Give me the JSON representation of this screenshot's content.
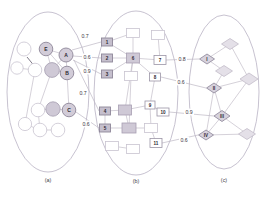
{
  "figure": {
    "type": "three-layer-network-diagram",
    "background_color": "#ffffff",
    "outline_color": "#b9b2c4",
    "shaded_node_color": "#cfc9d6",
    "edge_color": "#c3bdc9"
  },
  "panels": [
    {
      "id": "a",
      "caption": "(a)",
      "caption_x": 48,
      "caption_y": 180,
      "shape": "circle",
      "ellipse": {
        "cx": 48,
        "cy": 92,
        "rx": 41,
        "ry": 80
      }
    },
    {
      "id": "b",
      "caption": "(b)",
      "caption_x": 136,
      "caption_y": 181,
      "shape": "square",
      "ellipse": {
        "cx": 136,
        "cy": 93,
        "rx": 42,
        "ry": 82
      }
    },
    {
      "id": "c",
      "caption": "(c)",
      "caption_x": 224,
      "caption_y": 180,
      "shape": "diamond",
      "ellipse": {
        "cx": 224,
        "cy": 92,
        "rx": 35,
        "ry": 77
      }
    }
  ],
  "nodes_a": [
    {
      "id": "a1",
      "label": "",
      "x": 24,
      "y": 49,
      "r": 7.0,
      "style": "plain"
    },
    {
      "id": "a2",
      "label": "",
      "x": 17,
      "y": 68,
      "r": 6.2,
      "style": "plain"
    },
    {
      "id": "a3",
      "label": "",
      "x": 35,
      "y": 70,
      "r": 6.8,
      "style": "plain"
    },
    {
      "id": "aE",
      "label": "E",
      "x": 46,
      "y": 49,
      "r": 6.8,
      "style": "label"
    },
    {
      "id": "aA",
      "label": "A",
      "x": 66,
      "y": 55,
      "r": 7.0,
      "style": "label"
    },
    {
      "id": "a4",
      "label": "",
      "x": 52,
      "y": 70,
      "r": 7.4,
      "style": "shaded"
    },
    {
      "id": "aB",
      "label": "B",
      "x": 67,
      "y": 73,
      "r": 6.8,
      "style": "label"
    },
    {
      "id": "a5",
      "label": "",
      "x": 38,
      "y": 110,
      "r": 6.8,
      "style": "plain"
    },
    {
      "id": "a6",
      "label": "",
      "x": 53,
      "y": 109,
      "r": 7.2,
      "style": "shaded"
    },
    {
      "id": "aC",
      "label": "C",
      "x": 69,
      "y": 110,
      "r": 6.8,
      "style": "label"
    },
    {
      "id": "a7",
      "label": "",
      "x": 25,
      "y": 124,
      "r": 6.6,
      "style": "plain"
    },
    {
      "id": "a8",
      "label": "",
      "x": 40,
      "y": 130,
      "r": 6.8,
      "style": "plain"
    },
    {
      "id": "a9",
      "label": "",
      "x": 58,
      "y": 130,
      "r": 6.8,
      "style": "plain"
    }
  ],
  "edges_a": [
    {
      "from": "aE",
      "to": "aA"
    },
    {
      "from": "aE",
      "to": "a4"
    },
    {
      "from": "aE",
      "to": "aB"
    },
    {
      "from": "aA",
      "to": "aB"
    },
    {
      "from": "aA",
      "to": "a4"
    },
    {
      "from": "a4",
      "to": "aB"
    },
    {
      "from": "a5",
      "to": "a6"
    },
    {
      "from": "a6",
      "to": "aC"
    },
    {
      "from": "a7",
      "to": "a8"
    },
    {
      "from": "a8",
      "to": "a9"
    },
    {
      "from": "a8",
      "to": "a5"
    },
    {
      "from": "a3",
      "to": "a2"
    },
    {
      "from": "a4",
      "to": "a5"
    },
    {
      "from": "aB",
      "to": "aC"
    },
    {
      "from": "a3",
      "to": "a7"
    }
  ],
  "edge_a_dark": {
    "x1": 27,
    "y1": 57,
    "x2": 40,
    "y2": 73
  },
  "nodes_b": [
    {
      "id": "b1",
      "label": "1",
      "x": 107,
      "y": 42,
      "w": 11,
      "h": 8,
      "style": "labelshaded"
    },
    {
      "id": "b2",
      "label": "2",
      "x": 107,
      "y": 58,
      "w": 11,
      "h": 8,
      "style": "labelshaded"
    },
    {
      "id": "b3",
      "label": "3",
      "x": 107,
      "y": 74,
      "w": 11,
      "h": 8,
      "style": "labelshaded"
    },
    {
      "id": "b4",
      "label": "4",
      "x": 105,
      "y": 111,
      "w": 11,
      "h": 8,
      "style": "labelshaded"
    },
    {
      "id": "b5",
      "label": "5",
      "x": 105,
      "y": 128,
      "w": 11,
      "h": 8,
      "style": "labelshaded"
    },
    {
      "id": "b6",
      "label": "6",
      "x": 133,
      "y": 58,
      "w": 13,
      "h": 10,
      "style": "shaded"
    },
    {
      "id": "b7",
      "label": "7",
      "x": 160,
      "y": 60,
      "w": 12,
      "h": 9,
      "style": "label"
    },
    {
      "id": "b8",
      "label": "8",
      "x": 155,
      "y": 77,
      "w": 11,
      "h": 8,
      "style": "label"
    },
    {
      "id": "b9",
      "label": "9",
      "x": 150,
      "y": 105,
      "w": 10,
      "h": 8,
      "style": "label"
    },
    {
      "id": "b10",
      "label": "10",
      "x": 163,
      "y": 112,
      "w": 12,
      "h": 8,
      "style": "label"
    },
    {
      "id": "b11",
      "label": "11",
      "x": 156,
      "y": 143,
      "w": 12,
      "h": 9,
      "style": "label"
    },
    {
      "id": "b12",
      "label": "",
      "x": 133,
      "y": 33,
      "w": 13,
      "h": 9,
      "style": "plain"
    },
    {
      "id": "b13",
      "label": "",
      "x": 158,
      "y": 35,
      "w": 13,
      "h": 9,
      "style": "plain"
    },
    {
      "id": "b14",
      "label": "",
      "x": 131,
      "y": 76,
      "w": 13,
      "h": 9,
      "style": "plain"
    },
    {
      "id": "b15",
      "label": "",
      "x": 125,
      "y": 110,
      "w": 13,
      "h": 10,
      "style": "shaded"
    },
    {
      "id": "b16",
      "label": "",
      "x": 129,
      "y": 128,
      "w": 14,
      "h": 10,
      "style": "shaded"
    },
    {
      "id": "b17",
      "label": "",
      "x": 151,
      "y": 128,
      "w": 13,
      "h": 9,
      "style": "plain"
    },
    {
      "id": "b18",
      "label": "",
      "x": 112,
      "y": 146,
      "w": 13,
      "h": 9,
      "style": "plain"
    },
    {
      "id": "b19",
      "label": "",
      "x": 133,
      "y": 149,
      "w": 13,
      "h": 9,
      "style": "plain"
    }
  ],
  "edges_b": [
    {
      "from": "b1",
      "to": "b6"
    },
    {
      "from": "b2",
      "to": "b6"
    },
    {
      "from": "b3",
      "to": "b6"
    },
    {
      "from": "b6",
      "to": "b7"
    },
    {
      "from": "b6",
      "to": "b12"
    },
    {
      "from": "b6",
      "to": "b14"
    },
    {
      "from": "b6",
      "to": "b8"
    },
    {
      "from": "b12",
      "to": "b1"
    },
    {
      "from": "b7",
      "to": "b13"
    },
    {
      "from": "b8",
      "to": "b9"
    },
    {
      "from": "b9",
      "to": "b17"
    },
    {
      "from": "b4",
      "to": "b15"
    },
    {
      "from": "b15",
      "to": "b9"
    },
    {
      "from": "b5",
      "to": "b16"
    },
    {
      "from": "b16",
      "to": "b15"
    },
    {
      "from": "b16",
      "to": "b17"
    },
    {
      "from": "b17",
      "to": "b11"
    },
    {
      "from": "b18",
      "to": "b19"
    },
    {
      "from": "b6",
      "to": "b15"
    },
    {
      "from": "b14",
      "to": "b16"
    },
    {
      "from": "b4",
      "to": "b5"
    },
    {
      "from": "b10",
      "to": "b9"
    }
  ],
  "nodes_c": [
    {
      "id": "c1",
      "label": "I",
      "x": 207,
      "y": 59,
      "w": 15,
      "h": 10,
      "style": "label"
    },
    {
      "id": "c2",
      "label": "II",
      "x": 214,
      "y": 88,
      "w": 15,
      "h": 10,
      "style": "label"
    },
    {
      "id": "c3",
      "label": "III",
      "x": 222,
      "y": 116,
      "w": 16,
      "h": 11,
      "style": "label"
    },
    {
      "id": "c4",
      "label": "IV",
      "x": 206,
      "y": 135,
      "w": 15,
      "h": 10,
      "style": "label"
    },
    {
      "id": "cd1",
      "label": "",
      "x": 230,
      "y": 44,
      "w": 17,
      "h": 11,
      "style": "plain"
    },
    {
      "id": "cd2",
      "label": "",
      "x": 224,
      "y": 71,
      "w": 17,
      "h": 11,
      "style": "plain"
    },
    {
      "id": "cd3",
      "label": "",
      "x": 249,
      "y": 79,
      "w": 18,
      "h": 12,
      "style": "plain"
    },
    {
      "id": "cd4",
      "label": "",
      "x": 247,
      "y": 134,
      "w": 17,
      "h": 11,
      "style": "plain"
    }
  ],
  "edges_c": [
    {
      "from": "c1",
      "to": "cd1"
    },
    {
      "from": "c1",
      "to": "cd2"
    },
    {
      "from": "cd1",
      "to": "cd3"
    },
    {
      "from": "cd2",
      "to": "c2"
    },
    {
      "from": "cd3",
      "to": "c2"
    },
    {
      "from": "c2",
      "to": "c3"
    },
    {
      "from": "c3",
      "to": "c4"
    },
    {
      "from": "c3",
      "to": "cd4"
    },
    {
      "from": "c4",
      "to": "cd4"
    },
    {
      "from": "cd3",
      "to": "c3"
    },
    {
      "from": "c4",
      "to": "c2"
    }
  ],
  "inter_edges_ab": [
    {
      "weight": "0.7",
      "label_x": 85,
      "label_y": 36,
      "x1": 72,
      "y1": 50,
      "x2": 101,
      "y2": 42
    },
    {
      "weight": "0.6",
      "label_x": 87,
      "label_y": 57,
      "x1": 73,
      "y1": 56,
      "x2": 101,
      "y2": 58
    },
    {
      "weight": "0.9",
      "label_x": 87,
      "label_y": 71,
      "x1": 73,
      "y1": 60,
      "x2": 101,
      "y2": 74
    },
    {
      "weight": "0.7",
      "label_x": 83,
      "label_y": 93,
      "x1": 74,
      "y1": 60,
      "x2": 99,
      "y2": 111
    },
    {
      "weight": "0.6",
      "label_x": 86,
      "label_y": 124,
      "x1": 76,
      "y1": 112,
      "x2": 99,
      "y2": 128
    }
  ],
  "inter_edges_bc": [
    {
      "weight": "0.8",
      "label_x": 182,
      "label_y": 59,
      "x1": 166,
      "y1": 60,
      "x2": 199,
      "y2": 59
    },
    {
      "weight": "0.6",
      "label_x": 181,
      "label_y": 82,
      "x1": 161,
      "y1": 77,
      "x2": 206,
      "y2": 88
    },
    {
      "weight": "0.9",
      "label_x": 189,
      "label_y": 112,
      "x1": 169,
      "y1": 112,
      "x2": 214,
      "y2": 116
    },
    {
      "weight": "0.6",
      "label_x": 184,
      "label_y": 140,
      "x1": 162,
      "y1": 143,
      "x2": 198,
      "y2": 135
    }
  ]
}
